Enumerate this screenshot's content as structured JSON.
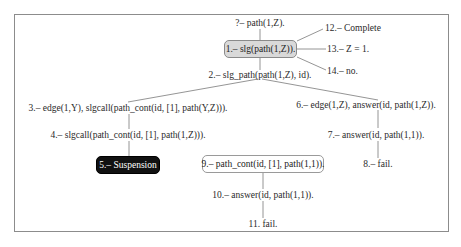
{
  "diagram": {
    "type": "slg-resolution-tree",
    "query": "?– path(1,Z).",
    "nodes": {
      "n1": "1.– slg(path(1,Z)).",
      "n2": "2.– slg_path(path(1,Z), id).",
      "n3": "3.– edge(1,Y), slgcall(path_cont(id, [1], path(Y,Z))).",
      "n4": "4.– slgcall(path_cont(id, [1], path(1,Z))).",
      "n5": "5.– Suspension",
      "n6": "6.– edge(1,Z), answer(id, path(1,Z)).",
      "n7": "7.– answer(id, path(1,1)).",
      "n8": "8.– fail.",
      "n9": "9.– path_cont(id, [1], path(1,1)).",
      "n10": "10.– answer(id, path(1,1)).",
      "n11": "11. fail.",
      "n12": "12.– Complete",
      "n13": "13.– Z = 1.",
      "n14": "14.– no."
    },
    "edges": [
      [
        "query",
        "n1"
      ],
      [
        "n1",
        "n2"
      ],
      [
        "n1",
        "n12"
      ],
      [
        "n1",
        "n13"
      ],
      [
        "n1",
        "n14"
      ],
      [
        "n2",
        "n3"
      ],
      [
        "n2",
        "n6"
      ],
      [
        "n3",
        "n4"
      ],
      [
        "n4",
        "n5"
      ],
      [
        "n6",
        "n7"
      ],
      [
        "n7",
        "n8"
      ],
      [
        "n9",
        "n10"
      ],
      [
        "n10",
        "n11"
      ]
    ],
    "colors": {
      "highlight_box": "#d9d9d9",
      "suspension_box": "#111111",
      "edge_line": "#777777",
      "frame": "#8c8c8c"
    }
  }
}
